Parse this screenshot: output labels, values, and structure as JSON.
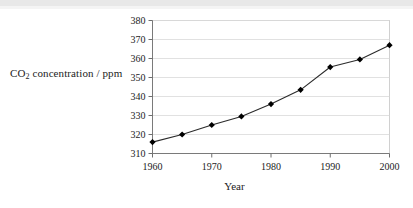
{
  "chart_data": {
    "type": "line",
    "title": "",
    "xlabel": "Year",
    "ylabel": "CO2 concentration / ppm",
    "ylabel_prefix": "CO",
    "ylabel_sub": "2",
    "ylabel_suffix": " concentration / ppm",
    "x": [
      1960,
      1965,
      1970,
      1975,
      1980,
      1985,
      1990,
      1995,
      2000
    ],
    "values": [
      316,
      320,
      325,
      329.5,
      336,
      343.5,
      355.5,
      359.5,
      367
    ],
    "xlim": [
      1960,
      2000
    ],
    "ylim": [
      310,
      380
    ],
    "xticks": [
      1960,
      1970,
      1980,
      1990,
      2000
    ],
    "xticklabels": [
      "1960",
      "1970",
      "1980",
      "1990",
      "2000"
    ],
    "yticks": [
      310,
      320,
      330,
      340,
      350,
      360,
      370,
      380
    ],
    "yticklabels": [
      "310",
      "320",
      "330",
      "340",
      "350",
      "360",
      "370",
      "380"
    ],
    "grid": "horizontal",
    "legend": "none",
    "marker": "diamond",
    "line_color": "#2b2b2b",
    "marker_color": "#000000",
    "grid_color": "#d9d9d9",
    "axis_color": "#808080",
    "plot_border_color": "#d0d0d0",
    "background": "#ffffff"
  }
}
